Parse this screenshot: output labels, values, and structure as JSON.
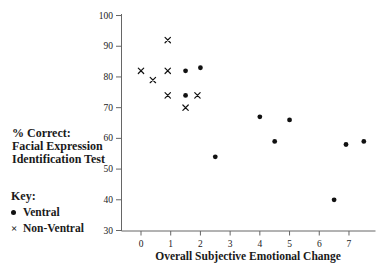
{
  "left_panel": {
    "y_axis_title_lines": [
      "% Correct:",
      "Facial Expression",
      "Identification Test"
    ],
    "key": {
      "title": "Key:",
      "items": [
        {
          "marker": "filled-circle",
          "label": "Ventral"
        },
        {
          "marker": "x-cross",
          "label": "Non-Ventral"
        }
      ]
    }
  },
  "chart_data": {
    "type": "scatter",
    "title": "",
    "xlabel": "Overall Subjective Emotional Change",
    "ylabel": "% Correct: Facial Expression Identification Test",
    "xlim": [
      -0.8,
      8
    ],
    "ylim": [
      30,
      100
    ],
    "x_ticks": [
      0,
      1,
      2,
      3,
      4,
      5,
      6,
      7
    ],
    "y_ticks": [
      30,
      40,
      50,
      60,
      70,
      80,
      90,
      100
    ],
    "grid": false,
    "legend_position": "left-bottom",
    "marker_color": "#111111",
    "axis_color": "#666666",
    "series": [
      {
        "name": "Ventral",
        "marker": "filled-circle",
        "points": [
          [
            1.5,
            82
          ],
          [
            2.0,
            83
          ],
          [
            1.5,
            74
          ],
          [
            2.5,
            54
          ],
          [
            4.0,
            67
          ],
          [
            4.5,
            59
          ],
          [
            5.0,
            66
          ],
          [
            6.5,
            40
          ],
          [
            6.9,
            58
          ],
          [
            7.5,
            59
          ]
        ]
      },
      {
        "name": "Non-Ventral",
        "marker": "x",
        "points": [
          [
            0.9,
            92
          ],
          [
            0.0,
            82
          ],
          [
            0.9,
            82
          ],
          [
            0.4,
            79
          ],
          [
            0.9,
            74
          ],
          [
            1.9,
            74
          ],
          [
            1.5,
            70
          ]
        ]
      }
    ]
  }
}
